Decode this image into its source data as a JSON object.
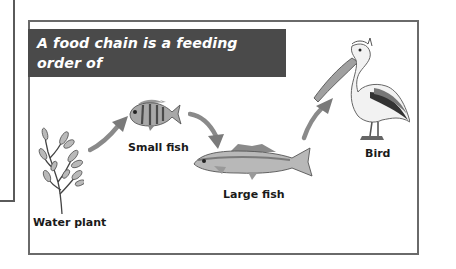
{
  "figure": {
    "caption": "A food chain is a feeding order of organisms within a community.",
    "caption_lines": [
      "A food chain is a feeding order of",
      "organisms within a community."
    ],
    "organisms": [
      {
        "label": "Water plant",
        "icon": "water-plant-icon"
      },
      {
        "label": "Small fish",
        "icon": "small-fish-icon"
      },
      {
        "label": "Large fish",
        "icon": "large-fish-icon"
      },
      {
        "label": "Bird",
        "icon": "pelican-icon"
      }
    ],
    "arrows": [
      "Water plant → Small fish",
      "Small fish → Large fish",
      "Large fish → Bird"
    ],
    "colors": {
      "banner_bg": "#4a4a4a",
      "banner_text": "#ffffff",
      "arrow": "#8a8a8a",
      "frame": "#6a6a6a"
    }
  }
}
